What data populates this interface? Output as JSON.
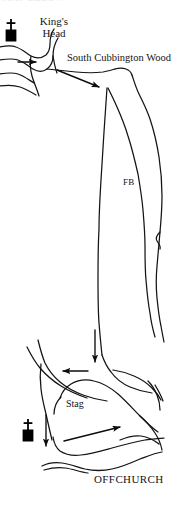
{
  "map": {
    "title": "Offchurch and South Cubbington Wood sketch map",
    "background_color": "#ffffff",
    "ink_color": "#141414",
    "labels": {
      "kings_head": "King's\nHead",
      "kings_head_line1": "King's",
      "kings_head_line2": "Head",
      "south_cubbington_wood": "South Cubbington Wood",
      "fb": "FB",
      "stag": "Stag",
      "offchurch": "OFFCHURCH",
      "cropped_top_text": "MAP BELOW"
    },
    "symbols": [
      {
        "name": "church-symbol-kings-head",
        "type": "church",
        "description": "cross above filled black square",
        "x": 3,
        "y": 18,
        "color": "#000000"
      },
      {
        "name": "church-symbol-offchurch",
        "type": "church",
        "description": "cross above filled black square",
        "x": 20,
        "y": 418,
        "color": "#000000"
      }
    ],
    "arrows": [
      {
        "name": "arrow-kings-head-east",
        "direction": "right",
        "description": "short arrow pointing east at the King's Head junction"
      },
      {
        "name": "arrow-to-south-cubbington-wood",
        "direction": "right-down",
        "description": "long diagonal arrow pointing toward South Cubbington Wood boundary"
      },
      {
        "name": "arrow-down-to-junction",
        "direction": "down",
        "description": "vertical arrow descending to the lower road junction"
      },
      {
        "name": "arrow-west-at-junction",
        "direction": "left",
        "description": "arrow pointing west away from the junction"
      },
      {
        "name": "arrow-down-past-church",
        "direction": "down",
        "description": "vertical arrow descending past the Offchurch church symbol"
      },
      {
        "name": "arrow-east-through-offchurch",
        "direction": "right",
        "description": "long arrow pointing east through Offchurch village"
      }
    ],
    "features": [
      {
        "name": "road-network",
        "type": "roads",
        "description": "hand-drawn double-line lanes and junctions"
      },
      {
        "name": "footbridge-route",
        "type": "route",
        "description": "two long near-parallel lines running north-south labelled FB"
      },
      {
        "name": "village-outline",
        "type": "settlement",
        "description": "closed loop of lanes forming Offchurch village around the Stag"
      }
    ]
  }
}
